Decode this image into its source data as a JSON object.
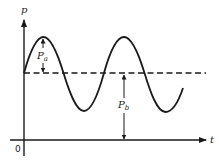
{
  "diagram": {
    "type": "pressure-time waveform",
    "y_axis_label": "p",
    "x_axis_label": "t",
    "origin_label": "0",
    "amplitude_label": {
      "main": "P",
      "sub": "a"
    },
    "baseline_label": {
      "main": "P",
      "sub": "b"
    },
    "colors": {
      "stroke": "#1a1a1a",
      "background": "#ffffff"
    },
    "waveform": {
      "shape": "sine",
      "cycles": 2.2,
      "baseline_style": "dashed"
    }
  }
}
